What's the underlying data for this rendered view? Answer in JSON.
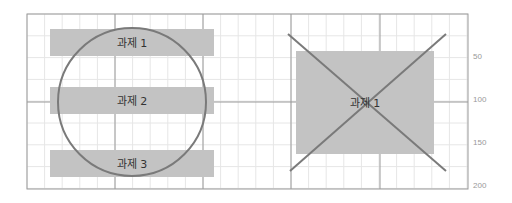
{
  "left_panel": {
    "bars": [
      {
        "label": "과제 1",
        "x": 50,
        "y": 29,
        "w": 164,
        "h": 27
      },
      {
        "label": "과제 2",
        "x": 50,
        "y": 87,
        "w": 164,
        "h": 27
      },
      {
        "label": "과제 3",
        "x": 50,
        "y": 150,
        "w": 164,
        "h": 27
      }
    ],
    "circle": {
      "cx": 132,
      "cy": 102,
      "r": 74
    }
  },
  "right_panel": {
    "box": {
      "label": "과제 1",
      "x": 296,
      "y": 51,
      "w": 138,
      "h": 103
    }
  },
  "axis": {
    "ticks": [
      {
        "label": "50",
        "y": 56
      },
      {
        "label": "100",
        "y": 99
      },
      {
        "label": "150",
        "y": 142
      },
      {
        "label": "200",
        "y": 185
      }
    ]
  },
  "colors": {
    "bar": "#c3c3c3",
    "shape_stroke": "#7a7a7a",
    "grid_minor": "#e6e6e6",
    "grid_major": "#9a9a9a"
  }
}
